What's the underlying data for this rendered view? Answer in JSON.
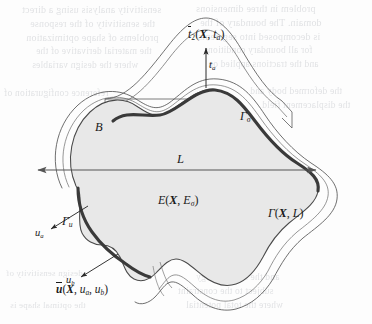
{
  "figure": {
    "caption_visible": false,
    "background_color": "#fdfdfd",
    "body_fill_color": "#e8e8e8",
    "outline_color": "#4a4a4a",
    "boundary_band_color": "#3a3a3a",
    "arrow_color": "#555555",
    "ghost_text_color": "#b9bcc2"
  },
  "labels": {
    "body": "B",
    "traction_field": {
      "base": "t",
      "bar": true,
      "sub": "2",
      "args": "(X, t",
      "arg_sub": "a",
      "close": ")"
    },
    "traction_field_plain": "t̄2(X, ta)",
    "traction_distance": {
      "base": "t",
      "sub": "a"
    },
    "traction_distance_plain": "ta",
    "traction_boundary": {
      "base": "Γ",
      "sub": "σ"
    },
    "traction_boundary_plain": "Γσ",
    "length": "L",
    "energy_field": {
      "base": "E",
      "args": "(X, E",
      "arg_sub": "σ",
      "close": ")"
    },
    "energy_field_plain": "E(X, Eσ)",
    "contour_field": {
      "base": "Γ",
      "args": "(X, L)"
    },
    "contour_field_plain": "Γ(X, L)",
    "displacement_boundary": {
      "base": "Γ",
      "sub": "u"
    },
    "displacement_boundary_plain": "Γu",
    "disp_a": {
      "base": "u",
      "sub": "a"
    },
    "disp_a_plain": "ua",
    "disp_b": {
      "base": "u",
      "sub": "b"
    },
    "disp_b_plain": "ub",
    "displacement_field": {
      "base": "u",
      "bar": true,
      "args": "(X, u",
      "arg_sub_a": "a",
      "mid": ", u",
      "arg_sub_b": "b",
      "close": ")"
    },
    "displacement_field_plain": "ū(X, ua, ub)"
  },
  "ghost_text": {
    "note": "faint mirrored show-through text from the reverse of the scanned page",
    "lines": [
      {
        "text": "sensitivity analysis using a direct",
        "x": 22,
        "y": 4,
        "size": 10
      },
      {
        "text": "problem in three dimensions",
        "x": 196,
        "y": 3,
        "size": 10
      },
      {
        "text": "the sensitivity of the response",
        "x": 30,
        "y": 18,
        "size": 10
      },
      {
        "text": "domain. The boundary of the",
        "x": 200,
        "y": 17,
        "size": 10
      },
      {
        "text": "problems of shape optimization",
        "x": 26,
        "y": 32,
        "size": 10
      },
      {
        "text": "is decomposed into segments",
        "x": 198,
        "y": 31,
        "size": 10
      },
      {
        "text": "the material derivative of the",
        "x": 36,
        "y": 46,
        "size": 9.5
      },
      {
        "text": "for all boundary conditions",
        "x": 204,
        "y": 45,
        "size": 9.5
      },
      {
        "text": "where the design variables",
        "x": 32,
        "y": 60,
        "size": 9.5
      },
      {
        "text": "and the tractions applied on",
        "x": 208,
        "y": 59,
        "size": 9.5
      },
      {
        "text": "reference configuration of",
        "x": 4,
        "y": 88,
        "size": 9.5
      },
      {
        "text": "the deformed body and",
        "x": 250,
        "y": 86,
        "size": 9.5
      },
      {
        "text": "the displacement field",
        "x": 262,
        "y": 100,
        "size": 9.5
      },
      {
        "text": "of the given surface",
        "x": 200,
        "y": 152,
        "size": 9
      },
      {
        "text": "is evaluated at each",
        "x": 150,
        "y": 236,
        "size": 9
      },
      {
        "text": "and the strain energy",
        "x": 196,
        "y": 272,
        "size": 9.5
      },
      {
        "text": "subject to the constraint",
        "x": 178,
        "y": 286,
        "size": 9.5
      },
      {
        "text": "where the total potential",
        "x": 186,
        "y": 300,
        "size": 9.5
      },
      {
        "text": "design sensitivity of",
        "x": 6,
        "y": 268,
        "size": 9
      },
      {
        "text": "the optimal shape is",
        "x": 10,
        "y": 300,
        "size": 9
      }
    ]
  },
  "geometry": {
    "description": "Reference body B (shaded blob) with an offset deformed outline; thick dark bands mark the traction boundary on the upper-right and the displacement boundary on the lower-left.",
    "body_path": "M 76,184 C 66,160 72,130 90,112 C 106,96 124,98 136,106 C 148,114 156,118 170,110 C 186,101 196,88 214,90 C 232,92 242,104 254,120 C 266,136 280,152 296,162 C 310,171 318,178 316,190 C 314,203 300,212 288,222 C 276,232 268,244 262,256 C 256,268 248,278 236,282 C 224,286 212,282 202,274 C 192,266 184,258 176,258 C 168,258 162,266 156,272 C 150,278 142,282 134,278 C 126,274 124,264 120,256 C 116,248 110,244 102,244 C 94,244 86,240 82,232 C 78,224 80,212 80,202 C 80,194 80,190 76,184 Z",
    "deformed_path": "M 62,186 C 50,160 58,126 80,106 C 100,88 122,90 136,99 C 150,108 158,112 170,103 C 184,93 196,78 218,80 C 240,82 252,98 264,116 C 276,134 292,152 310,164 C 326,175 336,184 334,198 C 332,213 316,224 302,236 C 288,248 280,262 272,276 C 264,290 252,302 238,306 C 222,310 208,304 196,294 C 186,286 180,280 174,280 C 168,280 164,288 158,294",
    "traction_band_path": "M 118,120 C 134,110 150,118 170,110 C 188,102 198,88 216,90 C 234,92 244,106 256,122 C 268,138 282,153 298,163 C 308,170 314,176 314,184",
    "displacement_band_path": "M 76,186 C 76,200 80,216 90,230 C 100,244 112,254 124,262 C 132,268 140,272 148,274",
    "dimension_arrow": {
      "x1": 38,
      "y1": 170,
      "x2": 316,
      "y2": 170
    }
  }
}
